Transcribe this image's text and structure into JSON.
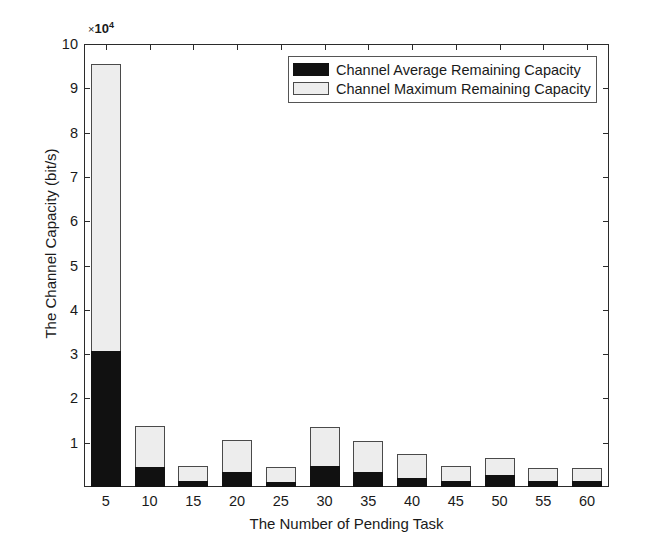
{
  "chart_data": {
    "type": "bar",
    "title": "",
    "subtitle": "",
    "xlabel": "The Number of Pending Task",
    "ylabel": "The Channel Capacity (bit/s)",
    "y_multiplier_prefix": "×",
    "y_multiplier_base": "10",
    "y_multiplier_exponent": "4",
    "categories": [
      "5",
      "10",
      "15",
      "20",
      "25",
      "30",
      "35",
      "40",
      "45",
      "50",
      "55",
      "60"
    ],
    "x": [
      5,
      10,
      15,
      20,
      25,
      30,
      35,
      40,
      45,
      50,
      55,
      60
    ],
    "xlim": [
      2.5,
      62.5
    ],
    "ylim": [
      0,
      10
    ],
    "y_ticks": [
      1,
      2,
      3,
      4,
      5,
      6,
      7,
      8,
      9,
      10
    ],
    "y_tick_labels": [
      "1",
      "2",
      "3",
      "4",
      "5",
      "6",
      "7",
      "8",
      "9",
      "10"
    ],
    "x_ticks": [
      5,
      10,
      15,
      20,
      25,
      30,
      35,
      40,
      45,
      50,
      55,
      60
    ],
    "x_tick_labels": [
      "5",
      "10",
      "15",
      "20",
      "25",
      "30",
      "35",
      "40",
      "45",
      "50",
      "55",
      "60"
    ],
    "grid": false,
    "legend_position": "top-center-right",
    "bar_style": "overlaid",
    "series": [
      {
        "name": "Channel Maximum Remaining Capacity",
        "color": "#ededed",
        "values": [
          9.55,
          1.38,
          0.48,
          1.07,
          0.45,
          1.36,
          1.05,
          0.75,
          0.47,
          0.65,
          0.43,
          0.43
        ]
      },
      {
        "name": "Channel Average Remaining Capacity",
        "color": "#111111",
        "values": [
          3.08,
          0.45,
          0.13,
          0.33,
          0.12,
          0.48,
          0.33,
          0.21,
          0.14,
          0.28,
          0.14,
          0.14
        ]
      }
    ],
    "annotations": []
  },
  "legend": {
    "entries": [
      {
        "label": "Channel Average Remaining Capacity",
        "swatch": "black"
      },
      {
        "label": "Channel Maximum Remaining Capacity",
        "swatch": "light-gray"
      }
    ]
  }
}
